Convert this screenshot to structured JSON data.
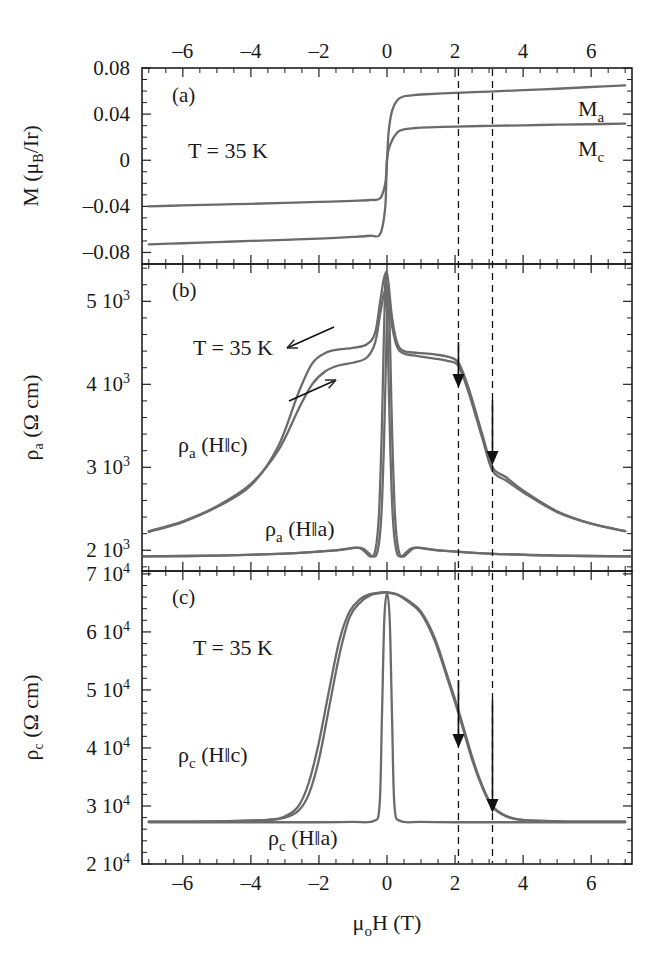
{
  "figure": {
    "x_axis": {
      "label_mu": "μ",
      "label_sub": "o",
      "label_rest": "H (T)",
      "full_label": "μₒH (T)",
      "min": -7.2,
      "max": 7.2,
      "major_ticks": [
        -6,
        -4,
        -2,
        0,
        2,
        4,
        6
      ],
      "major_tick_labels": [
        "–6",
        "–4",
        "–2",
        "0",
        "2",
        "4",
        "6"
      ],
      "minor_tick_step": 0.5,
      "top_axis_labeled": true,
      "bottom_axis_labeled": true
    },
    "marker_lines": {
      "values": [
        2.1,
        3.1
      ],
      "style": "dashed",
      "color": "#111111"
    }
  },
  "panels": [
    {
      "id": "a",
      "letter": "(a)",
      "y_label_main": "M (",
      "y_label_mu": "μ",
      "y_label_sub": "B",
      "y_label_tail": "/Ir)",
      "y_label_full": "M (μ_B/Ir)",
      "y_min": -0.09,
      "y_max": 0.08,
      "y_major_ticks": [
        0.08,
        0.04,
        0,
        -0.04,
        -0.08
      ],
      "y_major_tick_labels": [
        "0.08",
        "0.04",
        "0",
        "–0.04",
        "–0.08"
      ],
      "temperature": "T = 35 K",
      "curve_labels": [
        {
          "text": "M",
          "sub": "a",
          "full": "Mₐ"
        },
        {
          "text": "M",
          "sub": "c",
          "full": "M_c"
        }
      ]
    },
    {
      "id": "b",
      "letter": "(b)",
      "y_label_rho": "ρ",
      "y_label_sub": "a",
      "y_label_tail": " (Ω cm)",
      "y_label_full": "ρₐ (Ω cm)",
      "y_min": 1750,
      "y_max": 5450,
      "y_major_ticks": [
        5000,
        4000,
        3000,
        2000
      ],
      "y_major_tick_labels": [
        "5 10",
        "4 10",
        "3 10",
        "2 10"
      ],
      "y_exponent": "3",
      "temperature": "T = 35 K",
      "curve_labels": [
        {
          "rho": "ρ",
          "sub": "a",
          "tail": " (H‖c)",
          "full": "ρₐ (H‖c)"
        },
        {
          "rho": "ρ",
          "sub": "a",
          "tail": " (H‖a)",
          "full": "ρₐ (H‖a)"
        }
      ],
      "hysteresis_arrows": 2,
      "marker_arrows": 2
    },
    {
      "id": "c",
      "letter": "(c)",
      "y_label_rho": "ρ",
      "y_label_sub": "c",
      "y_label_tail": " (Ω cm)",
      "y_label_full": "ρ_c (Ω cm)",
      "y_min": 20000,
      "y_max": 70500,
      "y_major_ticks": [
        70000,
        60000,
        50000,
        40000,
        30000,
        20000
      ],
      "y_major_tick_labels": [
        "7 10",
        "6 10",
        "5 10",
        "4 10",
        "3 10",
        "2 10"
      ],
      "y_exponent": "4",
      "temperature": "T = 35 K",
      "curve_labels": [
        {
          "rho": "ρ",
          "sub": "c",
          "tail": " (H‖c)",
          "full": "ρ_c (H‖c)"
        },
        {
          "rho": "ρ",
          "sub": "c",
          "tail": " (H‖a)",
          "full": "ρ_c (H‖a)"
        }
      ],
      "marker_arrows": 2
    }
  ],
  "chart_data": {
    "type": "line",
    "title": "",
    "xlabel": "μₒH (T)",
    "xlim": [
      -7.2,
      7.2
    ],
    "grid": false,
    "legend": "inline-annotations",
    "subplots": [
      {
        "panel": "a",
        "ylabel": "M (μ_B/Ir)",
        "ylim": [
          -0.09,
          0.08
        ],
        "yticks": [
          -0.08,
          -0.04,
          0,
          0.04,
          0.08
        ],
        "series": [
          {
            "name": "M_a",
            "comment": "magnetization along a-axis, hysteretic step at H=0",
            "x": [
              -7.0,
              -6.0,
              -5.0,
              -4.0,
              -3.0,
              -2.0,
              -1.0,
              -0.5,
              -0.2,
              -0.05,
              0.0,
              0.05,
              0.15,
              0.3,
              0.5,
              0.8,
              1.0,
              2.0,
              3.0,
              4.0,
              5.0,
              6.0,
              7.0
            ],
            "y": [
              -0.04,
              -0.0392,
              -0.0385,
              -0.0378,
              -0.037,
              -0.0362,
              -0.0352,
              -0.0345,
              -0.033,
              -0.02,
              0.0,
              0.025,
              0.043,
              0.052,
              0.0555,
              0.0565,
              0.057,
              0.0585,
              0.0595,
              0.0608,
              0.062,
              0.0635,
              0.065
            ]
          },
          {
            "name": "M_c",
            "comment": "magnetization along c-axis, smaller saturated moment",
            "x": [
              -7.0,
              -6.0,
              -5.0,
              -4.0,
              -3.0,
              -2.0,
              -1.0,
              -0.5,
              -0.2,
              -0.05,
              0.0,
              0.1,
              0.3,
              0.5,
              0.8,
              1.0,
              2.0,
              3.0,
              4.0,
              5.0,
              6.0,
              7.0
            ],
            "y": [
              -0.073,
              -0.072,
              -0.071,
              -0.07,
              -0.069,
              -0.068,
              -0.0665,
              -0.0655,
              -0.064,
              -0.04,
              0.0,
              0.014,
              0.024,
              0.0268,
              0.0278,
              0.0282,
              0.0292,
              0.0298,
              0.0303,
              0.0308,
              0.0312,
              0.0318
            ]
          }
        ]
      },
      {
        "panel": "b",
        "ylabel": "ρ_a (Ω cm)",
        "ylim": [
          1750,
          5450
        ],
        "yticks": [
          2000,
          3000,
          4000,
          5000
        ],
        "series": [
          {
            "name": "ρ_a (H‖c) down-sweep",
            "x": [
              -7.0,
              -6.0,
              -5.0,
              -4.0,
              -3.2,
              -2.6,
              -2.2,
              -1.8,
              -1.4,
              -1.0,
              -0.6,
              -0.35,
              -0.2,
              -0.1,
              -0.03,
              0.0,
              0.05,
              0.15,
              0.3,
              0.5,
              0.9,
              1.4,
              1.8,
              2.1,
              2.4,
              2.8,
              3.1,
              3.5,
              4.0,
              5.0,
              6.0,
              7.0
            ],
            "y": [
              2220,
              2340,
              2520,
              2780,
              3250,
              3900,
              4250,
              4380,
              4420,
              4440,
              4480,
              4620,
              5000,
              5260,
              5350,
              5340,
              5200,
              4800,
              4500,
              4400,
              4380,
              4360,
              4330,
              4260,
              3950,
              3400,
              3000,
              2880,
              2720,
              2470,
              2320,
              2230
            ]
          },
          {
            "name": "ρ_a (H‖c) up-sweep",
            "x": [
              -7.0,
              -6.0,
              -5.0,
              -4.0,
              -3.2,
              -2.6,
              -2.2,
              -1.8,
              -1.4,
              -1.0,
              -0.6,
              -0.35,
              -0.2,
              -0.1,
              -0.03,
              0.0,
              0.05,
              0.15,
              0.3,
              0.5,
              0.9,
              1.4,
              1.8,
              2.1,
              2.4,
              2.8,
              3.1,
              3.5,
              4.0,
              5.0,
              6.0,
              7.0
            ],
            "y": [
              2230,
              2350,
              2530,
              2800,
              3200,
              3700,
              4000,
              4160,
              4230,
              4260,
              4320,
              4500,
              4850,
              5080,
              5150,
              5140,
              5050,
              4700,
              4450,
              4370,
              4340,
              4310,
              4280,
              4220,
              3900,
              3350,
              2960,
              2840,
              2700,
              2460,
              2320,
              2230
            ]
          },
          {
            "name": "ρ_a (H‖a)",
            "x": [
              -7.0,
              -6.0,
              -5.0,
              -4.0,
              -3.0,
              -2.0,
              -1.0,
              -0.5,
              -0.25,
              -0.12,
              -0.05,
              0.0,
              0.05,
              0.12,
              0.25,
              0.5,
              1.0,
              2.0,
              3.0,
              4.0,
              5.0,
              6.0,
              7.0
            ],
            "y": [
              2230,
              2350,
              2520,
              2780,
              3150,
              3700,
              4400,
              4850,
              5100,
              5250,
              5320,
              5330,
              5320,
              5250,
              5100,
              4850,
              4400,
              3700,
              3150,
              2780,
              2520,
              2350,
              2230
            ],
            "comment": "narrow central spike; baseline near 1950 outside +-0.3 T"
          }
        ],
        "annotations": [
          {
            "type": "down-arrow",
            "x": 2.1
          },
          {
            "type": "down-arrow",
            "x": 3.1
          },
          {
            "type": "hysteresis-arrow",
            "direction": "up-left"
          },
          {
            "type": "hysteresis-arrow",
            "direction": "up-right"
          }
        ]
      },
      {
        "panel": "c",
        "ylabel": "ρ_c (Ω cm)",
        "ylim": [
          20000,
          70500
        ],
        "yticks": [
          20000,
          30000,
          40000,
          50000,
          60000,
          70000
        ],
        "series": [
          {
            "name": "ρ_c (H‖c) down-sweep",
            "x": [
              -7.0,
              -5.0,
              -3.5,
              -3.0,
              -2.6,
              -2.3,
              -2.0,
              -1.7,
              -1.4,
              -1.1,
              -0.8,
              -0.5,
              -0.2,
              0.0,
              0.3,
              0.6,
              1.0,
              1.4,
              1.8,
              2.1,
              2.5,
              2.8,
              3.1,
              3.5,
              4.0,
              5.0,
              6.0,
              7.0
            ],
            "y": [
              27300,
              27350,
              27600,
              28000,
              29200,
              32000,
              38000,
              47000,
              56000,
              62500,
              65000,
              66300,
              66700,
              66800,
              66500,
              65500,
              63500,
              59000,
              52000,
              46500,
              38500,
              33500,
              30000,
              28300,
              27600,
              27350,
              27300,
              27300
            ]
          },
          {
            "name": "ρ_c (H‖c) up-sweep",
            "x": [
              -7.0,
              -5.0,
              -3.5,
              -3.0,
              -2.6,
              -2.3,
              -2.0,
              -1.7,
              -1.4,
              -1.1,
              -0.8,
              -0.5,
              -0.2,
              0.0,
              0.3,
              0.6,
              1.0,
              1.4,
              1.8,
              2.1,
              2.5,
              2.8,
              3.1,
              3.5,
              4.0,
              5.0,
              6.0,
              7.0
            ],
            "y": [
              27300,
              27350,
              27600,
              28200,
              30000,
              34000,
              41000,
              50000,
              58500,
              63500,
              65600,
              66500,
              66800,
              66800,
              66400,
              65300,
              63200,
              58500,
              51500,
              46000,
              38000,
              33200,
              29800,
              28200,
              27550,
              27350,
              27300,
              27300
            ]
          },
          {
            "name": "ρ_c (H‖a)",
            "x": [
              -7.0,
              -4.0,
              -2.0,
              -1.0,
              -0.4,
              -0.22,
              -0.15,
              -0.08,
              0.0,
              0.08,
              0.15,
              0.22,
              0.4,
              1.0,
              2.0,
              4.0,
              7.0
            ],
            "y": [
              27200,
              27200,
              27200,
              27250,
              27400,
              30000,
              45000,
              62000,
              66700,
              62000,
              45000,
              30000,
              27400,
              27250,
              27200,
              27200,
              27200
            ],
            "comment": "flat baseline with narrow central plateau spike"
          }
        ],
        "annotations": [
          {
            "type": "down-arrow",
            "x": 2.1
          },
          {
            "type": "down-arrow",
            "x": 3.1
          }
        ]
      }
    ]
  }
}
